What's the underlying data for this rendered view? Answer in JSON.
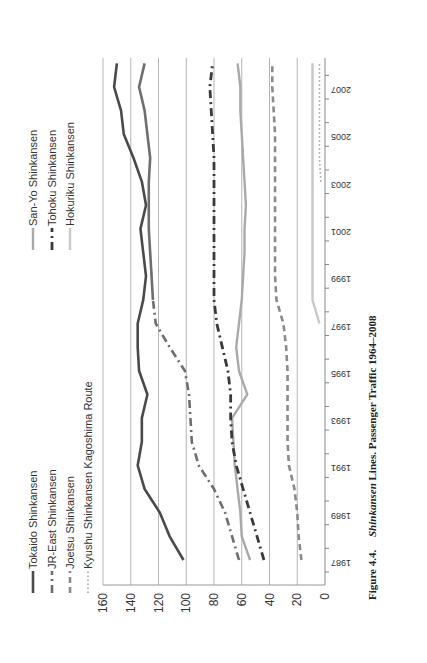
{
  "chart_data": {
    "type": "line",
    "orientation": "rotated 90 degrees counter-clockwise",
    "title": "",
    "caption": {
      "figure_label": "Figure 4.4.",
      "italic_part": "Shinkansen",
      "rest": "Lines. Passenger Traffic 1964–2008"
    },
    "xlabel": "",
    "ylabel": "",
    "ylim": [
      0,
      160
    ],
    "y_ticks": [
      0,
      20,
      40,
      60,
      80,
      100,
      120,
      140,
      160
    ],
    "x_tick_labels": [
      "1987",
      "1989",
      "1991",
      "1993",
      "1995",
      "1997",
      "1999",
      "2001",
      "2003",
      "2005",
      "2007"
    ],
    "x": [
      1987,
      1988,
      1989,
      1990,
      1991,
      1992,
      1993,
      1994,
      1995,
      1996,
      1997,
      1998,
      1999,
      2000,
      2001,
      2002,
      2003,
      2004,
      2005,
      2006,
      2007,
      2008
    ],
    "grid": true,
    "legend_position": "left (top in unrotated frame)",
    "series": [
      {
        "name": "Tokaido Shinkansen",
        "style": "solid",
        "color": "#4a4a4a",
        "width": 2.6,
        "values": [
          102,
          112,
          119,
          130,
          135,
          132,
          132,
          128,
          134,
          135,
          135,
          131,
          129,
          131,
          133,
          129,
          132,
          138,
          145,
          147,
          152,
          150
        ]
      },
      {
        "name": "JR-East Shinkansen",
        "style": "dash-dot",
        "color": "#6e6e6e",
        "width": 2.6,
        "values": [
          62,
          67,
          72,
          80,
          91,
          96,
          97,
          98,
          101,
          112,
          122,
          124,
          null,
          null,
          null,
          null,
          null,
          null,
          null,
          null,
          null,
          null
        ]
      },
      {
        "name": "JR-East Shinkansen (cont.)",
        "style": "solid",
        "color": "#6e6e6e",
        "width": 2.6,
        "hidden_legend": true,
        "values": [
          null,
          null,
          null,
          null,
          null,
          null,
          null,
          null,
          null,
          null,
          null,
          124,
          125,
          126,
          127,
          127,
          127,
          126,
          128,
          130,
          134,
          130
        ]
      },
      {
        "name": "Joetsu Shinkansen",
        "style": "dashed",
        "color": "#8a8a8a",
        "width": 2.6,
        "values": [
          17,
          19,
          20,
          22,
          26,
          27,
          27,
          27,
          27,
          28,
          30,
          35,
          36,
          36,
          36,
          36,
          36,
          36,
          36,
          37,
          38,
          38
        ]
      },
      {
        "name": "Kyushu Shinkansen Kagoshima Route",
        "style": "dotted",
        "color": "#a0a0a0",
        "width": 1.6,
        "values": [
          null,
          null,
          null,
          null,
          null,
          null,
          null,
          null,
          null,
          null,
          null,
          null,
          null,
          null,
          null,
          null,
          3,
          4,
          4,
          4,
          4,
          4
        ]
      },
      {
        "name": "San-Yo Shinkansen",
        "style": "solid",
        "color": "#a9a9a9",
        "width": 2.4,
        "values": [
          54,
          60,
          61,
          63,
          65,
          66,
          67,
          56,
          62,
          64,
          62,
          60,
          59,
          58,
          58,
          57,
          58,
          59,
          60,
          61,
          61,
          63
        ]
      },
      {
        "name": "Tohoku Shinkansen",
        "style": "dash-dot",
        "color": "#3a3a3a",
        "width": 2.8,
        "values": [
          44,
          49,
          54,
          59,
          64,
          67,
          68,
          68,
          70,
          74,
          78,
          80,
          80,
          80,
          80,
          80,
          80,
          80,
          81,
          82,
          83,
          81
        ]
      },
      {
        "name": "Hokuriku Shinkansen",
        "style": "solid",
        "color": "#c8c8c8",
        "width": 2.4,
        "values": [
          null,
          null,
          null,
          null,
          null,
          null,
          null,
          null,
          null,
          null,
          4,
          9,
          9,
          9,
          9,
          9,
          9,
          9,
          9,
          9,
          9,
          9
        ]
      }
    ]
  },
  "legend": {
    "left_column": [
      "Tokaido Shinkansen",
      "JR-East Shinkansen",
      "Joetsu Shinkansen",
      "Kyushu Shinkansen Kagoshima Route"
    ],
    "right_column": [
      "San-Yo Shinkansen",
      "Tohoku Shinkansen",
      "Hokuriku Shinkansen"
    ]
  }
}
